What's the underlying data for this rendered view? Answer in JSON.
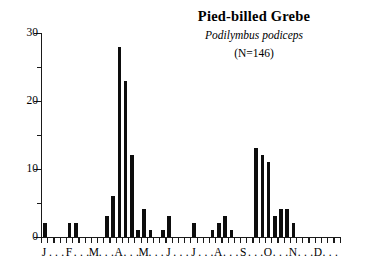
{
  "figure": {
    "type": "phenology-bar-chart",
    "background_color": "#ffffff",
    "ink_color": "#0d0d0d"
  },
  "title": {
    "common_name": "Pied-billed Grebe",
    "scientific_name": "Podilymbus podiceps",
    "sample_size": "(N=146)"
  },
  "chart_data": {
    "type": "bar",
    "title": "Pied-billed Grebe",
    "subtitle": "Podilymbus podiceps",
    "annotation": "(N=146)",
    "xlabel": "",
    "ylabel": "",
    "ylim": [
      0,
      30
    ],
    "y_ticks_major": [
      0,
      10,
      20,
      30
    ],
    "y_ticks_minor": [
      5,
      15,
      25
    ],
    "grid": false,
    "legend": "none",
    "x_axis_type": "weekly-bins-over-year",
    "n_bins": 48,
    "categories": [
      "J-1",
      "J-2",
      "J-3",
      "J-4",
      "F-1",
      "F-2",
      "F-3",
      "F-4",
      "M-1",
      "M-2",
      "M-3",
      "M-4",
      "A-1",
      "A-2",
      "A-3",
      "A-4",
      "M-1",
      "M-2",
      "M-3",
      "M-4",
      "J-1",
      "J-2",
      "J-3",
      "J-4",
      "J-1",
      "J-2",
      "J-3",
      "J-4",
      "A-1",
      "A-2",
      "A-3",
      "A-4",
      "S-1",
      "S-2",
      "S-3",
      "S-4",
      "O-1",
      "O-2",
      "O-3",
      "O-4",
      "N-1",
      "N-2",
      "N-3",
      "N-4",
      "D-1",
      "D-2",
      "D-3",
      "D-4"
    ],
    "values": [
      2,
      0,
      0,
      0,
      2,
      2,
      0,
      0,
      0,
      0,
      3,
      6,
      28,
      23,
      12,
      1,
      4,
      1,
      0,
      1,
      3,
      0,
      0,
      0,
      2,
      0,
      0,
      1,
      2,
      3,
      1,
      0,
      0,
      0,
      13,
      12,
      11,
      3,
      4,
      4,
      2,
      0,
      0,
      0,
      0,
      0,
      0,
      0
    ],
    "month_labels": [
      "J",
      "F",
      "M",
      "A",
      "M",
      "J",
      "J",
      "A",
      "S",
      "O",
      "N",
      "D"
    ],
    "month_label_separator": "."
  },
  "axis": {
    "y_tick_labels": [
      "0",
      "10",
      "20",
      "30"
    ]
  }
}
